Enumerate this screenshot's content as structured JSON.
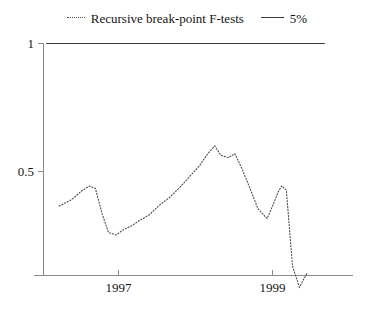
{
  "figure": {
    "width": 374,
    "height": 310,
    "background": "#ffffff"
  },
  "legend": {
    "position": "top-center",
    "entries": [
      {
        "label": "Recursive break-point F-tests",
        "style": "dotted",
        "color": "#4a4a4a",
        "icon": "dotted-line-swatch"
      },
      {
        "label": "5%",
        "style": "solid",
        "color": "#3c3c3c",
        "icon": "solid-line-swatch"
      }
    ]
  },
  "axes": {
    "y": {
      "ticks": [
        {
          "label": "1",
          "value": 1
        },
        {
          "label": "0.5",
          "value": 0.5
        }
      ],
      "range": [
        0,
        1
      ]
    },
    "x": {
      "ticks": [
        {
          "label": "1997",
          "value": 1997
        },
        {
          "label": "1999",
          "value": 1999
        }
      ],
      "range": [
        1996.05,
        1999.9
      ]
    }
  },
  "chart_data": {
    "type": "line",
    "title": "",
    "subtitle": "",
    "xlabel": "",
    "ylabel": "",
    "xlim": [
      1996.05,
      1999.9
    ],
    "ylim": [
      0,
      1
    ],
    "grid": false,
    "legend_position": "top-center",
    "series": [
      {
        "name": "Recursive break-point F-tests",
        "style": "dotted",
        "color": "#4a4a4a",
        "x": [
          1996.23,
          1996.39,
          1996.52,
          1996.62,
          1996.7,
          1996.79,
          1996.87,
          1996.97,
          1997.06,
          1997.16,
          1997.27,
          1997.4,
          1997.53,
          1997.66,
          1997.79,
          1997.92,
          1998.05,
          1998.16,
          1998.25,
          1998.33,
          1998.43,
          1998.51,
          1998.6,
          1998.7,
          1998.81,
          1998.93,
          1999.01,
          1999.07,
          1999.12,
          1999.18,
          1999.26,
          1999.35,
          1999.45
        ],
        "y": [
          0.365,
          0.39,
          0.424,
          0.443,
          0.434,
          0.332,
          0.262,
          0.252,
          0.272,
          0.286,
          0.308,
          0.331,
          0.368,
          0.398,
          0.436,
          0.479,
          0.522,
          0.57,
          0.6,
          0.563,
          0.554,
          0.57,
          0.513,
          0.44,
          0.355,
          0.316,
          0.372,
          0.418,
          0.444,
          0.427,
          0.13,
          0.048,
          0.104
        ]
      },
      {
        "name": "5%",
        "style": "solid",
        "color": "#3c3c3c",
        "x": [
          1996.06,
          1999.68
        ],
        "y": [
          1.0,
          1.0
        ]
      }
    ]
  }
}
